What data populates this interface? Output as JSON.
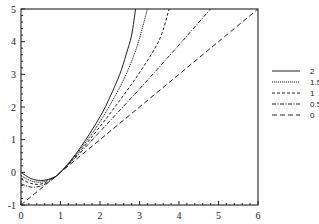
{
  "chart_data": {
    "type": "line",
    "title": "",
    "xlabel": "",
    "ylabel": "",
    "xlim": [
      0,
      6
    ],
    "ylim": [
      -1,
      5
    ],
    "x_ticks": [
      "0",
      "1",
      "2",
      "3",
      "4",
      "5",
      "6"
    ],
    "y_ticks": [
      "-1",
      "0",
      "1",
      "2",
      "3",
      "4",
      "5"
    ],
    "minor_ticks_per_unit": 5,
    "grid": false,
    "legend_position": "right",
    "series": [
      {
        "name": "2",
        "dash": "",
        "points": [
          [
            0,
            0.0
          ],
          [
            0.25,
            -0.19
          ],
          [
            0.5,
            -0.25
          ],
          [
            0.75,
            -0.19
          ],
          [
            1,
            0
          ],
          [
            1.5,
            0.75
          ],
          [
            2,
            1.7
          ],
          [
            2.25,
            2.3
          ],
          [
            2.5,
            3.0
          ],
          [
            2.66,
            3.6
          ],
          [
            2.8,
            4.2
          ],
          [
            2.9,
            5.0
          ]
        ]
      },
      {
        "name": "1.5",
        "dash": "1.2 0.8",
        "points": [
          [
            0,
            -0.1
          ],
          [
            0.25,
            -0.26
          ],
          [
            0.5,
            -0.3
          ],
          [
            0.75,
            -0.2
          ],
          [
            1,
            0
          ],
          [
            1.5,
            0.7
          ],
          [
            2,
            1.55
          ],
          [
            2.5,
            2.6
          ],
          [
            2.8,
            3.4
          ],
          [
            3.0,
            4.1
          ],
          [
            3.2,
            5.0
          ]
        ]
      },
      {
        "name": "1",
        "dash": "3 2",
        "points": [
          [
            0,
            -0.2
          ],
          [
            0.25,
            -0.34
          ],
          [
            0.5,
            -0.36
          ],
          [
            0.75,
            -0.22
          ],
          [
            1,
            0
          ],
          [
            1.5,
            0.65
          ],
          [
            2,
            1.4
          ],
          [
            2.5,
            2.2
          ],
          [
            3,
            3.05
          ],
          [
            3.5,
            4.05
          ],
          [
            3.75,
            5.0
          ]
        ]
      },
      {
        "name": "0.5",
        "dash": "4 1.5 1 1.5",
        "points": [
          [
            0,
            -0.35
          ],
          [
            0.25,
            -0.45
          ],
          [
            0.5,
            -0.42
          ],
          [
            0.75,
            -0.25
          ],
          [
            1,
            0
          ],
          [
            1.5,
            0.6
          ],
          [
            2,
            1.25
          ],
          [
            3,
            2.55
          ],
          [
            4,
            3.9
          ],
          [
            4.4,
            4.45
          ],
          [
            4.8,
            5.0
          ]
        ]
      },
      {
        "name": "0",
        "dash": "5 3",
        "points": [
          [
            0,
            -1
          ],
          [
            1,
            0
          ],
          [
            2,
            1
          ],
          [
            3,
            2
          ],
          [
            4,
            3
          ],
          [
            5,
            4
          ],
          [
            6,
            5
          ]
        ]
      }
    ]
  },
  "legend": {
    "items": [
      {
        "label": "2"
      },
      {
        "label": "1.5"
      },
      {
        "label": "1"
      },
      {
        "label": "0.5"
      },
      {
        "label": "0"
      }
    ]
  }
}
